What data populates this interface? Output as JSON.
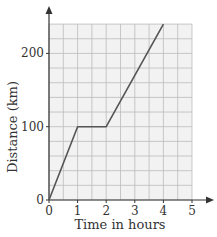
{
  "chart_data": {
    "type": "line",
    "title": "",
    "xlabel": "Time in hours",
    "ylabel": "Distance (km)",
    "xlim": [
      0,
      5
    ],
    "ylim": [
      0,
      240
    ],
    "x_ticks": [
      0,
      1,
      2,
      3,
      4,
      5
    ],
    "y_ticks": [
      0,
      100,
      200
    ],
    "grid": true,
    "grid_minor_x_step": 0.5,
    "grid_minor_y_step": 20,
    "series": [
      {
        "name": "Journey",
        "x": [
          0,
          1,
          2,
          4
        ],
        "y": [
          0,
          100,
          100,
          240
        ]
      }
    ],
    "colors": {
      "line": "#555555",
      "grid": "#bbbbbb",
      "plot_bg": "#f2f2f2",
      "axis": "#333333"
    }
  }
}
